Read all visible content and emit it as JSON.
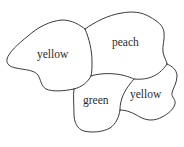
{
  "diagram": {
    "type": "map-coloring",
    "regions": [
      {
        "id": "left",
        "label": "yellow",
        "x": 37,
        "y": 58
      },
      {
        "id": "top-right",
        "label": "peach",
        "x": 112,
        "y": 46
      },
      {
        "id": "bottom-middle",
        "label": "green",
        "x": 83,
        "y": 104
      },
      {
        "id": "bottom-right",
        "label": "yellow",
        "x": 130,
        "y": 98
      }
    ],
    "colors": {
      "stroke": "#3a3a3a",
      "text": "#2b2b2b",
      "background": "#ffffff"
    }
  }
}
